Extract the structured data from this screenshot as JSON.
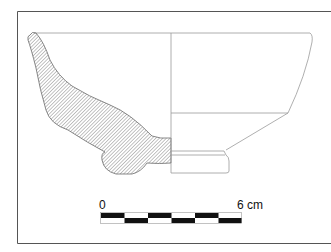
{
  "figure": {
    "type": "pottery-profile-drawing",
    "section_fill": "hatched",
    "colors": {
      "line": "#8a8a8a",
      "frame": "#555555",
      "hatch": "#7a7a7a",
      "scale_dark": "#111111",
      "scale_light": "#ffffff"
    }
  },
  "scale_bar": {
    "start_label": "0",
    "end_label": "6 cm",
    "segments": 6,
    "units": "cm"
  }
}
